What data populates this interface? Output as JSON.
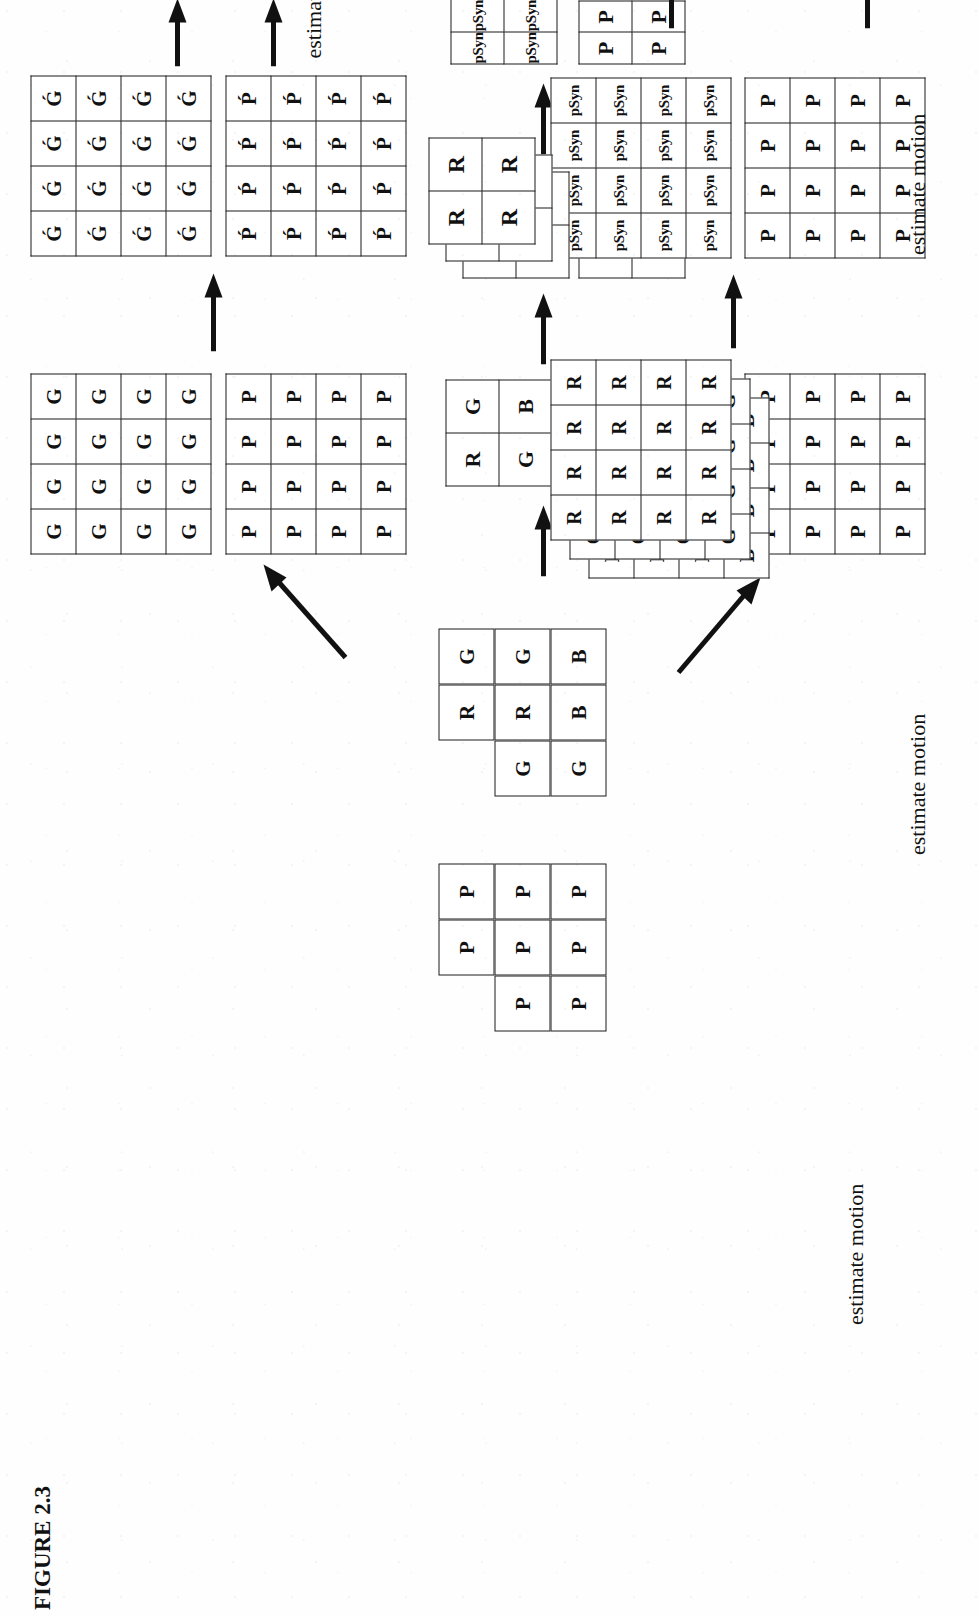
{
  "figure": {
    "caption_label": "FIGURE 2.3",
    "estimate_motion_label": "estimate motion"
  },
  "rows": {
    "top": {
      "name": "full-resolution-path",
      "grids": [
        {
          "name": "green-plane",
          "symbol": "G",
          "rows": 4,
          "cols": 4
        },
        {
          "name": "p-plane",
          "symbol": "P",
          "rows": 4,
          "cols": 4
        },
        {
          "name": "green-prime-plane",
          "symbol": "Ǵ",
          "rows": 4,
          "cols": 4
        },
        {
          "name": "p-prime-plane",
          "symbol": "Ṕ",
          "rows": 4,
          "cols": 4
        }
      ],
      "estimate_motion_count": 2
    },
    "middle": {
      "name": "downsampled-path",
      "bayer_cells": [
        {
          "symbol": "R",
          "row": 0,
          "col": 1
        },
        {
          "symbol": "G",
          "row": 0,
          "col": 2
        },
        {
          "symbol": "G",
          "row": 1,
          "col": 0
        },
        {
          "symbol": "R",
          "row": 1,
          "col": 1
        },
        {
          "symbol": "G",
          "row": 1,
          "col": 2
        },
        {
          "symbol": "G",
          "row": 2,
          "col": 0
        },
        {
          "symbol": "B",
          "row": 2,
          "col": 1
        },
        {
          "symbol": "B",
          "row": 2,
          "col": 2
        }
      ],
      "p_mosaic_cells": [
        {
          "symbol": "P",
          "row": 0,
          "col": 1
        },
        {
          "symbol": "P",
          "row": 0,
          "col": 2
        },
        {
          "symbol": "P",
          "row": 1,
          "col": 0
        },
        {
          "symbol": "P",
          "row": 1,
          "col": 1
        },
        {
          "symbol": "P",
          "row": 1,
          "col": 2
        },
        {
          "symbol": "P",
          "row": 2,
          "col": 0
        },
        {
          "symbol": "P",
          "row": 2,
          "col": 1
        },
        {
          "symbol": "P",
          "row": 2,
          "col": 2
        }
      ],
      "rgb_quad": {
        "name": "rgb-2x2",
        "cells": [
          [
            "R",
            "G"
          ],
          [
            "G",
            "B"
          ]
        ]
      },
      "p_quad": {
        "name": "p-2x2",
        "symbol": "P",
        "rows": 2,
        "cols": 2
      },
      "stack_quad": {
        "name": "rgb-plane-stack-2x2",
        "planes": [
          {
            "symbol": "B",
            "rows": 2,
            "cols": 2
          },
          {
            "symbol": "G",
            "rows": 2,
            "cols": 2
          },
          {
            "symbol": "R",
            "rows": 2,
            "cols": 2
          }
        ]
      },
      "psyn_quad": {
        "name": "psyn-2x2",
        "symbol": "pSyn",
        "rows": 2,
        "cols": 2
      },
      "estimate_motion_count": 2
    },
    "bottom": {
      "name": "demosaic-path",
      "p_grid": {
        "name": "p-plane-4x4",
        "symbol": "P",
        "rows": 4,
        "cols": 4
      },
      "stack": {
        "name": "rgb-plane-stack-4x4",
        "planes": [
          {
            "symbol": "B",
            "rows": 4,
            "cols": 4
          },
          {
            "symbol": "G",
            "rows": 4,
            "cols": 4
          },
          {
            "symbol": "R",
            "rows": 4,
            "cols": 4
          }
        ]
      },
      "psyn_grid": {
        "name": "psyn-plane-4x4",
        "symbol": "pSyn",
        "rows": 4,
        "cols": 4
      },
      "p_out_grid": {
        "name": "p-out-4x4",
        "symbol": "P",
        "rows": 4,
        "cols": 4
      },
      "estimate_motion_count": 2
    }
  },
  "colors": {
    "ink": "#111111",
    "paper": "#fefefe",
    "rule": "#1a1a1a"
  }
}
